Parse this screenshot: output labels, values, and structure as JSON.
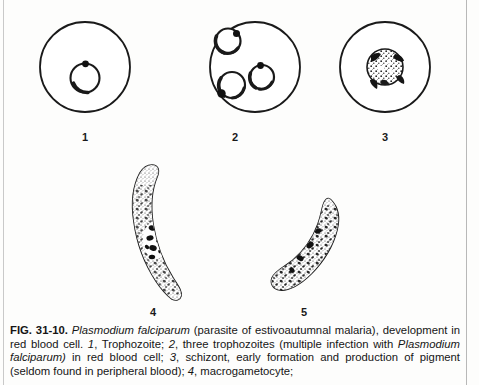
{
  "figure": {
    "id_label": "FIG. 31-10.",
    "panels": [
      {
        "number": "1",
        "name": "trophozoite-in-red-blood-cell",
        "description": "Trophozoite ring form inside red blood cell"
      },
      {
        "number": "2",
        "name": "three-trophozoites-multiple-infection",
        "description": "Three ring trophozoites, multiple infection of one red blood cell"
      },
      {
        "number": "3",
        "name": "schizont-early-formation",
        "description": "Schizont, early formation and production of pigment"
      },
      {
        "number": "4",
        "name": "macrogametocyte",
        "description": "Crescent-shaped macrogametocyte"
      },
      {
        "number": "5",
        "name": "microgametocyte",
        "description": "Sausage-shaped microgametocyte"
      }
    ]
  },
  "caption": {
    "fig_number": "FIG. 31-10.",
    "species": "Plasmodium falciparum",
    "segment_1": " (parasite of estivoautumnal malaria), development in red blood cell. ",
    "item_1_num": "1",
    "segment_2": ", Trophozoite; ",
    "item_2_num": "2",
    "segment_3": ", three trophozoites (multiple infection with ",
    "species_2": "Plasmodium falciparum)",
    "segment_4": " in red blood cell; ",
    "item_3_num": "3",
    "segment_5": ", schizont, early formation and production of pigment (seldom found in peripheral blood); ",
    "item_4_num": "4",
    "segment_6": ", macrogametocyte;"
  },
  "colors": {
    "ink": "#1a1a1a",
    "paper": "#fdfdfc",
    "rule": "#c9c9c9"
  }
}
